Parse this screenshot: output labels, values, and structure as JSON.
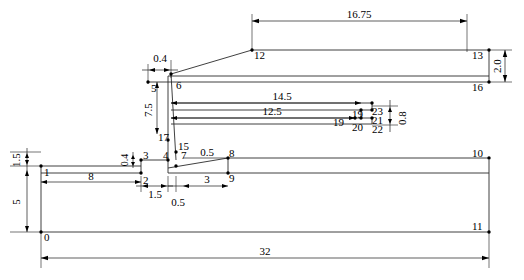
{
  "drawing": {
    "title": "Stepped section profile with dimensions",
    "units_note": "",
    "line_color": "#1a1a1a",
    "background": "#ffffff"
  },
  "dimensions": [
    {
      "id": "d-16-75",
      "value": "16.75",
      "orientation": "horizontal"
    },
    {
      "id": "d-2-0",
      "value": "2.0",
      "orientation": "vertical"
    },
    {
      "id": "d-0-4-top",
      "value": "0.4",
      "orientation": "horizontal"
    },
    {
      "id": "d-7-5",
      "value": "7.5",
      "orientation": "vertical"
    },
    {
      "id": "d-14-5",
      "value": "14.5",
      "orientation": "horizontal"
    },
    {
      "id": "d-12-5",
      "value": "12.5",
      "orientation": "horizontal"
    },
    {
      "id": "d-0-8",
      "value": "0.8",
      "orientation": "vertical"
    },
    {
      "id": "d-1-5-left",
      "value": "1.5",
      "orientation": "vertical"
    },
    {
      "id": "d-5-left",
      "value": "5",
      "orientation": "vertical"
    },
    {
      "id": "d-0-4-mid",
      "value": "0.4",
      "orientation": "vertical"
    },
    {
      "id": "d-0-5-upper",
      "value": "0.5",
      "orientation": "horizontal"
    },
    {
      "id": "d-8-lower",
      "value": "8",
      "orientation": "horizontal"
    },
    {
      "id": "d-1-5-lower",
      "value": "1.5",
      "orientation": "horizontal"
    },
    {
      "id": "d-0-5-lower",
      "value": "0.5",
      "orientation": "horizontal"
    },
    {
      "id": "d-3-lower",
      "value": "3",
      "orientation": "horizontal"
    },
    {
      "id": "d-32",
      "value": "32",
      "orientation": "horizontal"
    }
  ],
  "vertices": [
    {
      "n": "0"
    },
    {
      "n": "1"
    },
    {
      "n": "2"
    },
    {
      "n": "3"
    },
    {
      "n": "4"
    },
    {
      "n": "5"
    },
    {
      "n": "6"
    },
    {
      "n": "7"
    },
    {
      "n": "8"
    },
    {
      "n": "9"
    },
    {
      "n": "10"
    },
    {
      "n": "11"
    },
    {
      "n": "12"
    },
    {
      "n": "13"
    },
    {
      "n": "15"
    },
    {
      "n": "16"
    },
    {
      "n": "17"
    },
    {
      "n": "19"
    },
    {
      "n": "19"
    },
    {
      "n": "20"
    },
    {
      "n": "21"
    },
    {
      "n": "22"
    },
    {
      "n": "23"
    }
  ],
  "labels": {
    "p0": "0",
    "p1": "1",
    "p2": "2",
    "p3": "3",
    "p4": "4",
    "p5": "5",
    "p6": "6",
    "p7": "7",
    "p8": "8",
    "p9": "9",
    "p10": "10",
    "p11": "11",
    "p12": "12",
    "p13": "13",
    "p15": "15",
    "p16": "16",
    "p17": "17",
    "p18": "19",
    "p19": "19",
    "p20": "20",
    "p21": "21",
    "p22": "22",
    "p23": "23"
  },
  "dim_values": {
    "top_width": "16.75",
    "right_height": "2.0",
    "offset_top": "0.4",
    "mid_height": "7.5",
    "len_a": "14.5",
    "len_b": "12.5",
    "gap_right": "0.8",
    "left_upper": "1.5",
    "left_lower": "5",
    "offset_mid": "0.4",
    "step_upper": "0.5",
    "base_8": "8",
    "base_1_5": "1.5",
    "base_0_5": "0.5",
    "base_3": "3",
    "total_width": "32"
  }
}
